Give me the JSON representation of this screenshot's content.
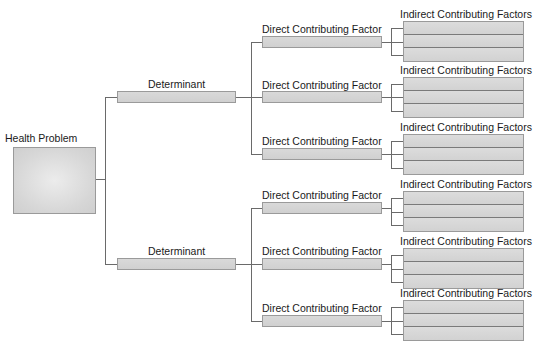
{
  "diagram": {
    "type": "tree",
    "root": {
      "label": "Health Problem"
    },
    "determinants": [
      {
        "label": "Determinant",
        "direct_factors": [
          {
            "label": "Direct Contributing Factor",
            "indirect_label": "Indirect Contributing Factors",
            "indirect_rows": 3
          },
          {
            "label": "Direct Contributing Factor",
            "indirect_label": "Indirect Contributing Factors",
            "indirect_rows": 3
          },
          {
            "label": "Direct Contributing Factor",
            "indirect_label": "Indirect Contributing Factors",
            "indirect_rows": 3
          }
        ]
      },
      {
        "label": "Determinant",
        "direct_factors": [
          {
            "label": "Direct Contributing Factor",
            "indirect_label": "Indirect Contributing Factors",
            "indirect_rows": 3
          },
          {
            "label": "Direct Contributing Factor",
            "indirect_label": "Indirect Contributing Factors",
            "indirect_rows": 3
          },
          {
            "label": "Direct Contributing Factor",
            "indirect_label": "Indirect Contributing Factors",
            "indirect_rows": 3
          }
        ]
      }
    ]
  }
}
